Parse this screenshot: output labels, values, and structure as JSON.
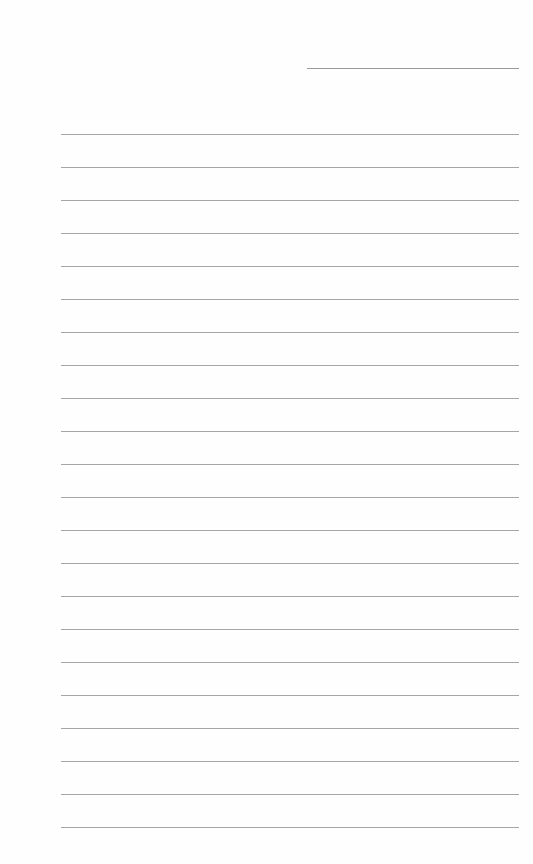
{
  "document": {
    "type": "lined-paper",
    "background_color": "#fefefe",
    "line_color": "#a6a6a6",
    "header_line": {
      "x": 307,
      "y": 68,
      "width": 212
    },
    "rules": {
      "count": 22,
      "x": 61,
      "width": 458,
      "first_y": 134,
      "spacing": 33
    }
  }
}
